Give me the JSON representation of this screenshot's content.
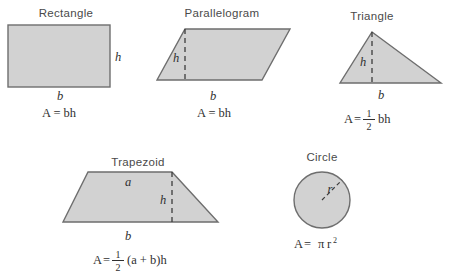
{
  "page": {
    "background_color": "#ffffff",
    "shape_fill_color": "#d2d2d2",
    "shape_stroke_color": "#6e6e6e"
  },
  "shapes": [
    {
      "id": "rectangle",
      "title": "Rectangle",
      "labels": {
        "base": "b",
        "height": "h"
      },
      "formula": {
        "lhs": "A",
        "eq": "=",
        "rhs": "bh",
        "plain": "A = bh"
      }
    },
    {
      "id": "parallelogram",
      "title": "Parallelogram",
      "labels": {
        "base": "b",
        "height": "h"
      },
      "formula": {
        "lhs": "A",
        "eq": "=",
        "rhs": "bh",
        "plain": "A = bh"
      }
    },
    {
      "id": "triangle",
      "title": "Triangle",
      "labels": {
        "base": "b",
        "height": "h"
      },
      "formula": {
        "lhs": "A",
        "eq": "=",
        "fraction": {
          "numerator": "1",
          "denominator": "2"
        },
        "rhs": "bh",
        "plain": "A = 1/2 bh"
      }
    },
    {
      "id": "trapezoid",
      "title": "Trapezoid",
      "labels": {
        "top_base": "a",
        "base": "b",
        "height": "h"
      },
      "formula": {
        "lhs": "A",
        "eq": "=",
        "fraction": {
          "numerator": "1",
          "denominator": "2"
        },
        "rhs": "(a + b)h",
        "plain": "A = 1/2 (a + b)h"
      }
    },
    {
      "id": "circle",
      "title": "Circle",
      "labels": {
        "radius": "r"
      },
      "formula": {
        "lhs": "A",
        "eq": "=",
        "pi": "π",
        "radius_var": "r",
        "exponent": "2",
        "plain": "A = πr²"
      }
    }
  ]
}
